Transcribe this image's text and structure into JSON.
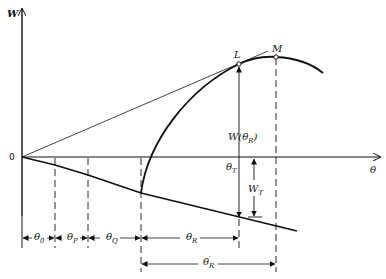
{
  "diagram": {
    "type": "geometric-construction",
    "axes": {
      "y_label": "W",
      "x_label": "θ",
      "origin_label": "0"
    },
    "points": {
      "L": "L",
      "M": "M"
    },
    "annotations": {
      "w_theta_r": {
        "main": "W(θ",
        "sub": "R",
        "close": ")"
      },
      "theta_t": {
        "main": "θ",
        "sub": "T"
      },
      "w_t": {
        "main": "W",
        "sub": "T"
      }
    },
    "intervals": [
      {
        "main": "θ",
        "sub": "0"
      },
      {
        "main": "θ",
        "sub": "P"
      },
      {
        "main": "θ",
        "sub": "Q"
      },
      {
        "main": "θ",
        "sub": "R"
      }
    ],
    "interval_prime": {
      "main": "θ",
      "sup": "′",
      "sub": "R"
    },
    "colors": {
      "ink": "#111111",
      "background": "#ffffff"
    }
  }
}
